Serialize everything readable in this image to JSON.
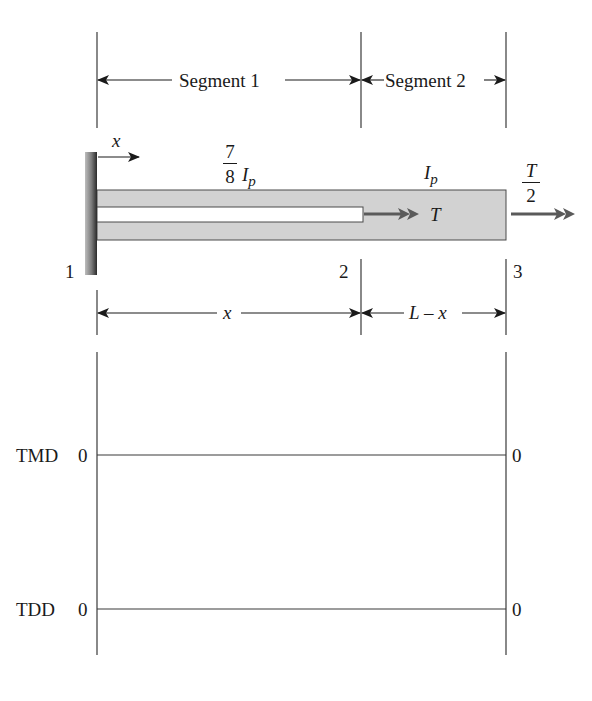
{
  "diagram": {
    "type": "torsion shaft with hollow segment and diagrams",
    "segments": {
      "segment1_label": "Segment 1",
      "segment2_label": "Segment 2"
    },
    "axis": {
      "x_label": "x"
    },
    "shaft": {
      "segment1_inertia_num": "7",
      "segment1_inertia_den": "8",
      "segment1_inertia_symbol": "I",
      "segment1_inertia_sub": "p",
      "segment2_inertia_symbol": "I",
      "segment2_inertia_sub": "p",
      "internal_torque_label": "T",
      "end_torque_num": "T",
      "end_torque_den": "2"
    },
    "nodes": {
      "n1": "1",
      "n2": "2",
      "n3": "3"
    },
    "dimensions": {
      "left": "x",
      "right": "L – x"
    },
    "plots": {
      "tmd": {
        "label": "TMD",
        "left_value": "0",
        "right_value": "0"
      },
      "tdd": {
        "label": "TDD",
        "left_value": "0",
        "right_value": "0"
      }
    },
    "colors": {
      "line": "#3a3a3a",
      "shaft_fill": "#d2d2d2",
      "wall_dark": "#3c3c3c",
      "wall_light": "#a8a8a8",
      "torque_arrow": "#5a5a5a"
    }
  }
}
